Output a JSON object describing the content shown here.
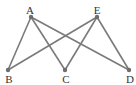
{
  "diagram": {
    "type": "graph",
    "colors": {
      "edge": "#7a7a7a",
      "node": "#6e6e6e",
      "label": "#333333"
    },
    "nodes": [
      {
        "id": "A",
        "label": "A",
        "x": 31,
        "y": 17,
        "lx": 30,
        "ly": 5
      },
      {
        "id": "E",
        "label": "E",
        "x": 97,
        "y": 17,
        "lx": 97,
        "ly": 5
      },
      {
        "id": "B",
        "label": "B",
        "x": 8,
        "y": 70,
        "lx": 9,
        "ly": 74
      },
      {
        "id": "C",
        "label": "C",
        "x": 65,
        "y": 70,
        "lx": 66,
        "ly": 74
      },
      {
        "id": "D",
        "label": "D",
        "x": 129,
        "y": 70,
        "lx": 130,
        "ly": 74
      }
    ],
    "edges": [
      [
        "A",
        "B"
      ],
      [
        "A",
        "C"
      ],
      [
        "A",
        "D"
      ],
      [
        "E",
        "B"
      ],
      [
        "E",
        "C"
      ],
      [
        "E",
        "D"
      ]
    ]
  }
}
